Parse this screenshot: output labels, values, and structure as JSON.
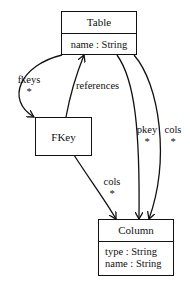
{
  "diagram": {
    "type": "uml-class-diagram",
    "classes": [
      {
        "id": "table",
        "name": "Table",
        "attributes": [
          "name : String"
        ]
      },
      {
        "id": "fkey",
        "name": "FKey",
        "attributes": []
      },
      {
        "id": "column",
        "name": "Column",
        "attributes": [
          "type : String",
          "name : String"
        ]
      }
    ],
    "associations": [
      {
        "from": "Table",
        "to": "FKey",
        "role": "fkeys",
        "multiplicity": "*"
      },
      {
        "from": "FKey",
        "to": "Table",
        "role": "references",
        "multiplicity": ""
      },
      {
        "from": "FKey",
        "to": "Column",
        "role": "cols",
        "multiplicity": "*"
      },
      {
        "from": "Table",
        "to": "Column",
        "role": "pkey",
        "multiplicity": "*"
      },
      {
        "from": "Table",
        "to": "Column",
        "role": "cols",
        "multiplicity": "*"
      }
    ]
  },
  "labels": {
    "fkeys": "fkeys",
    "fkeys_mult": "*",
    "references": "references",
    "fkey_cols": "cols",
    "fkey_cols_mult": "*",
    "pkey": "pkey",
    "pkey_mult": "*",
    "table_cols": "cols",
    "table_cols_mult": "*"
  }
}
